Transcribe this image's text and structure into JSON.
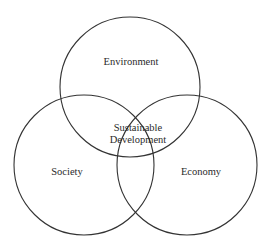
{
  "diagram": {
    "type": "venn",
    "circles": [
      {
        "name": "environment",
        "label": "Environment",
        "cx": 130,
        "cy": 87,
        "r": 70
      },
      {
        "name": "society",
        "label": "Society",
        "cx": 84,
        "cy": 165,
        "r": 70
      },
      {
        "name": "economy",
        "label": "Economy",
        "cx": 187,
        "cy": 165,
        "r": 70
      }
    ],
    "center_label_line1": "Sustainable",
    "center_label_line2": "Development",
    "stroke_color": "#333333",
    "background_color": "#ffffff"
  }
}
